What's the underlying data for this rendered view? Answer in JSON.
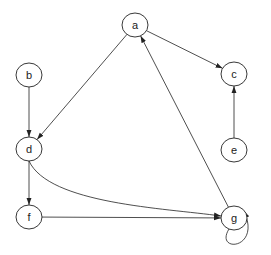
{
  "graph": {
    "nodes": [
      {
        "id": "a",
        "label": "a",
        "x": 135,
        "y": 25
      },
      {
        "id": "b",
        "label": "b",
        "x": 29,
        "y": 75
      },
      {
        "id": "c",
        "label": "c",
        "x": 234,
        "y": 74
      },
      {
        "id": "d",
        "label": "d",
        "x": 29,
        "y": 149
      },
      {
        "id": "e",
        "label": "e",
        "x": 234,
        "y": 150
      },
      {
        "id": "f",
        "label": "f",
        "x": 29,
        "y": 217
      },
      {
        "id": "g",
        "label": "g",
        "x": 234,
        "y": 218
      }
    ],
    "edges": [
      {
        "from": "a",
        "to": "c"
      },
      {
        "from": "a",
        "to": "d"
      },
      {
        "from": "b",
        "to": "d"
      },
      {
        "from": "e",
        "to": "c"
      },
      {
        "from": "g",
        "to": "a"
      },
      {
        "from": "d",
        "to": "f"
      },
      {
        "from": "d",
        "to": "g"
      },
      {
        "from": "f",
        "to": "g"
      },
      {
        "from": "g",
        "to": "g"
      }
    ]
  }
}
